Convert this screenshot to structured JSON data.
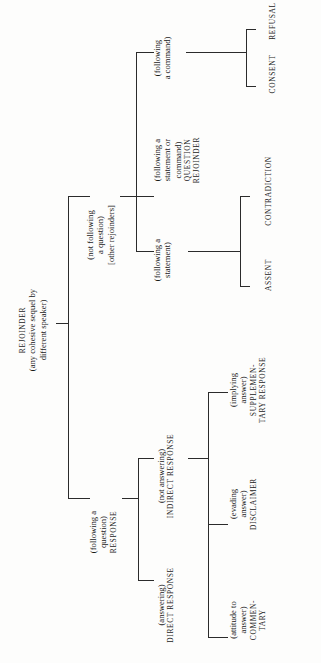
{
  "diagram": {
    "orientation": "rotated-90-ccw",
    "line_color": "#2b2b2b",
    "background": "#fdfdfc",
    "nodes": {
      "root": {
        "label_caps": "REJOINDER",
        "gloss_line_1": "(any cohesive sequel by",
        "gloss_line_2": "different speaker)"
      },
      "response": {
        "gloss_line_1": "(following a",
        "gloss_line_2": "question)",
        "label_caps": "RESPONSE"
      },
      "other_rejoinders": {
        "gloss_line_1": "(not following",
        "gloss_line_2": "a question)",
        "label_caps": "[other rejoinders]"
      },
      "direct_response": {
        "gloss_line_1": "(answering)",
        "label_caps": "DIRECT RESPONSE"
      },
      "indirect_response": {
        "gloss_line_1": "(not answering)",
        "label_caps": "INDIRECT RESPONSE"
      },
      "commentary": {
        "gloss_line_1": "(attitude to",
        "gloss_line_2": "answer)",
        "label_caps_1": "COMMEN-",
        "label_caps_2": "TARY"
      },
      "disclaimer": {
        "gloss_line_1": "(evading",
        "gloss_line_2": "answer)",
        "label_caps": "DISCLAIMER"
      },
      "supplementary_response": {
        "gloss_line_1": "(implying",
        "gloss_line_2": "answer)",
        "label_caps_1": "SUPPLEMEN-",
        "label_caps_2": "TARY RESPONSE"
      },
      "following_statement": {
        "gloss_line_1": "(following a",
        "gloss_line_2": "statement)"
      },
      "assent": {
        "label_caps": "ASSENT"
      },
      "contradiction": {
        "label_caps": "CONTRADICTION"
      },
      "question_rejoinder": {
        "gloss_line_1": "(following a",
        "gloss_line_2": "statement or",
        "gloss_line_3": "command)",
        "label_caps_1": "QUESTION",
        "label_caps_2": "REJOINDER"
      },
      "following_command": {
        "gloss_line_1": "(following",
        "gloss_line_2": "a command)"
      },
      "consent": {
        "label_caps": "CONSENT"
      },
      "refusal": {
        "label_caps": "REFUSAL"
      }
    }
  }
}
